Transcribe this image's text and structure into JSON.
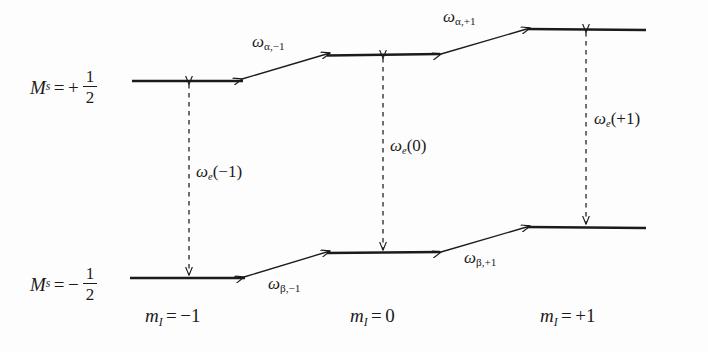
{
  "figure": {
    "type": "energy-level-diagram",
    "line_color": "#1b1b1b",
    "background_color": "#fdfdfd"
  },
  "state_labels": [
    {
      "id": "ms-plus-half",
      "prefix": "M",
      "sub": "s",
      "relation": "=",
      "sign": "+",
      "numerator": "1",
      "denominator": "2",
      "text": "M_s = + 1/2"
    },
    {
      "id": "ms-minus-half",
      "prefix": "M",
      "sub": "s",
      "relation": "=",
      "sign": "−",
      "numerator": "1",
      "denominator": "2",
      "text": "M_s = − 1/2"
    }
  ],
  "axis_labels": [
    {
      "id": "mi-minus-1",
      "prefix": "m",
      "sub": "I",
      "relation": "=",
      "value": "−1"
    },
    {
      "id": "mi-zero",
      "prefix": "m",
      "sub": "I",
      "relation": "=",
      "value": "0"
    },
    {
      "id": "mi-plus-1",
      "prefix": "m",
      "sub": "I",
      "relation": "=",
      "value": "+1"
    }
  ],
  "levels": [
    {
      "id": "upper-m1",
      "manifold": "alpha",
      "m_I": "-1",
      "x1": 132,
      "x2": 243,
      "y": 81
    },
    {
      "id": "upper-0",
      "manifold": "alpha",
      "m_I": "0",
      "x1": 327,
      "x2": 440,
      "y": 55
    },
    {
      "id": "upper-p1",
      "manifold": "alpha",
      "m_I": "+1",
      "x1": 527,
      "x2": 646,
      "y": 29
    },
    {
      "id": "lower-m1",
      "manifold": "beta",
      "m_I": "-1",
      "x1": 130,
      "x2": 245,
      "y": 278
    },
    {
      "id": "lower-0",
      "manifold": "beta",
      "m_I": "0",
      "x1": 327,
      "x2": 440,
      "y": 253
    },
    {
      "id": "lower-p1",
      "manifold": "beta",
      "m_I": "+1",
      "x1": 527,
      "x2": 646,
      "y": 227
    }
  ],
  "vertical_transitions": [
    {
      "id": "we-minus-1",
      "x": 189,
      "y_top": 81,
      "y_bottom": 278,
      "symbol": "ω",
      "sub": "e",
      "arg": "(−1)",
      "text": "ω_e(−1)"
    },
    {
      "id": "we-zero",
      "x": 383,
      "y_top": 55,
      "y_bottom": 253,
      "symbol": "ω",
      "sub": "e",
      "arg": "(0)",
      "text": "ω_e(0)"
    },
    {
      "id": "we-plus-1",
      "x": 586,
      "y_top": 29,
      "y_bottom": 227,
      "symbol": "ω",
      "sub": "e",
      "arg": "(+1)",
      "text": "ω_e(+1)"
    }
  ],
  "slanted_transitions": [
    {
      "id": "w-alpha-minus-1",
      "symbol": "ω",
      "sub": "α,−1",
      "text": "ω_α,−1",
      "x1": 243,
      "y1": 81,
      "x2": 327,
      "y2": 55
    },
    {
      "id": "w-alpha-plus-1",
      "symbol": "ω",
      "sub": "α,+1",
      "text": "ω_α,+1",
      "x1": 440,
      "y1": 55,
      "x2": 527,
      "y2": 29
    },
    {
      "id": "w-beta-minus-1",
      "symbol": "ω",
      "sub": "β,−1",
      "text": "ω_β,−1",
      "x1": 245,
      "y1": 278,
      "x2": 327,
      "y2": 253
    },
    {
      "id": "w-beta-plus-1",
      "symbol": "ω",
      "sub": "β,+1",
      "text": "ω_β,+1",
      "x1": 440,
      "y1": 253,
      "x2": 527,
      "y2": 227
    }
  ],
  "glyphs": {
    "omega": "ω",
    "alpha": "α",
    "beta": "β",
    "minus": "−",
    "plus": "+",
    "equals": "="
  }
}
